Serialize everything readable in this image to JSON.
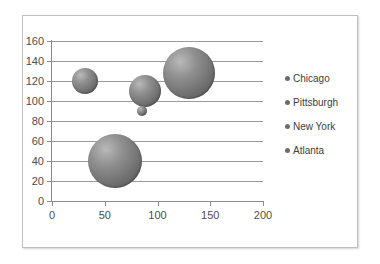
{
  "chart_data": {
    "type": "scatter",
    "title": "",
    "xlabel": "",
    "ylabel": "",
    "xlim": [
      0,
      200
    ],
    "ylim": [
      0,
      160
    ],
    "xticks": [
      0,
      50,
      100,
      150,
      200
    ],
    "yticks": [
      0,
      20,
      40,
      60,
      80,
      100,
      120,
      140,
      160
    ],
    "grid": "horizontal",
    "legend_position": "right",
    "bubble_fill": "#6f6f6f",
    "series": [
      {
        "name": "Chicago",
        "x": 31,
        "y": 120,
        "size": 26
      },
      {
        "name": "Pittsburgh",
        "x": 88,
        "y": 110,
        "size": 32
      },
      {
        "name": "New York",
        "x": 130,
        "y": 128,
        "size": 52
      },
      {
        "name": "Atlanta",
        "x": 60,
        "y": 40,
        "size": 54
      },
      {
        "name": "",
        "x": 85,
        "y": 90,
        "size": 10
      }
    ],
    "legend": [
      {
        "label": "Chicago",
        "color": "#6c6c6c"
      },
      {
        "label": "Pittsburgh",
        "color": "#6c6c6c"
      },
      {
        "label": "New York",
        "color": "#6c6c6c"
      },
      {
        "label": "Atlanta",
        "color": "#6c6c6c"
      }
    ],
    "y_tick_labels": [
      "0",
      "20",
      "40",
      "60",
      "80",
      "100",
      "120",
      "140",
      "160"
    ],
    "x_tick_labels": [
      "0",
      "50",
      "100",
      "150",
      "200"
    ]
  }
}
